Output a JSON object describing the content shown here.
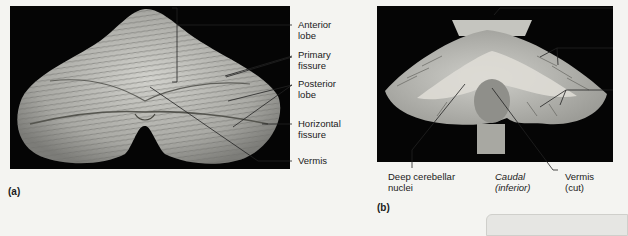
{
  "figure": {
    "panel_a": {
      "tag": "(a)",
      "labels": {
        "anterior_lobe": [
          "Anterior",
          "lobe"
        ],
        "primary_fissure": [
          "Primary",
          "fissure"
        ],
        "posterior_lobe": [
          "Posterior",
          "lobe"
        ],
        "horizontal_fissure": [
          "Horizontal",
          "fissure"
        ],
        "vermis": "Vermis"
      }
    },
    "panel_b": {
      "tag": "(b)",
      "labels": {
        "deep_nuclei": [
          "Deep cerebellar",
          "nuclei"
        ],
        "caudal": [
          "Caudal",
          "(inferior)"
        ],
        "vermis_cut": [
          "Vermis",
          "(cut)"
        ]
      }
    },
    "colors": {
      "background": "#f4f4f1",
      "photo_bg": "#050505",
      "tissue": "#b8b8b3",
      "leader_line": "#222222"
    }
  }
}
